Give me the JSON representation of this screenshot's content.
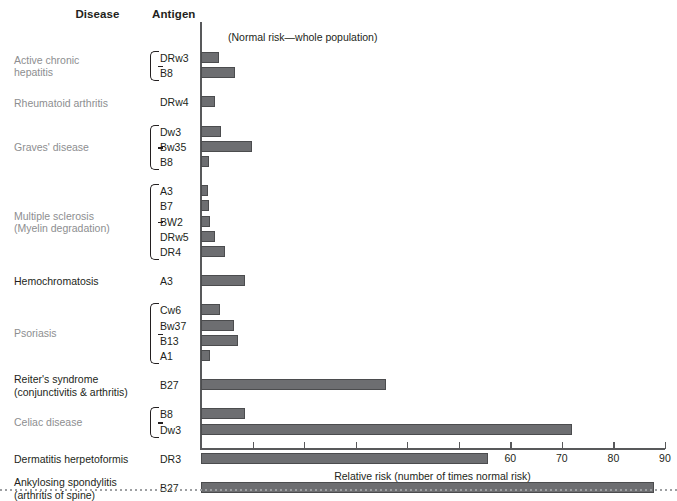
{
  "headers": {
    "disease": "Disease",
    "antigen": "Antigen"
  },
  "note": "(Normal risk—whole population)",
  "chart_data": {
    "type": "bar",
    "orientation": "horizontal",
    "title": "",
    "xlabel": "Relative risk (number of times normal risk)",
    "ylabel": "",
    "xlim": [
      0,
      90
    ],
    "xticks": [
      10,
      20,
      30,
      40,
      50,
      60,
      70,
      80,
      90
    ],
    "grid": false,
    "legend": null,
    "annotations": [
      "(Normal risk—whole population)"
    ],
    "categories": [
      "DRw3",
      "B8",
      "DRw4",
      "Dw3",
      "Bw35",
      "B8",
      "A3",
      "B7",
      "BW2",
      "DRw5",
      "DR4",
      "A3",
      "Cw6",
      "Bw37",
      "B13",
      "A1",
      "B27",
      "B8",
      "Dw3",
      "DR3",
      "B27"
    ],
    "values": [
      3.4,
      6.6,
      2.7,
      3.9,
      9.8,
      1.6,
      1.3,
      1.6,
      1.8,
      2.8,
      4.6,
      8.5,
      3.6,
      6.4,
      7.2,
      1.8,
      35.9,
      8.6,
      72.0,
      55.6,
      87.8
    ],
    "groups": [
      {
        "disease": "Active chronic hepatitis",
        "disease_lines": [
          "Active chronic",
          "hepatitis"
        ],
        "muted": true,
        "brace": true,
        "rows": [
          {
            "antigen": "DRw3",
            "value": 3.4
          },
          {
            "antigen": "B8",
            "value": 6.6
          }
        ]
      },
      {
        "disease": "Rheumatoid arthritis",
        "disease_lines": [
          "Rheumatoid arthritis"
        ],
        "muted": true,
        "brace": false,
        "rows": [
          {
            "antigen": "DRw4",
            "value": 2.7
          }
        ]
      },
      {
        "disease": "Graves' disease",
        "disease_lines": [
          "Graves' disease"
        ],
        "muted": true,
        "brace": true,
        "rows": [
          {
            "antigen": "Dw3",
            "value": 3.9
          },
          {
            "antigen": "Bw35",
            "value": 9.8
          },
          {
            "antigen": "B8",
            "value": 1.6
          }
        ]
      },
      {
        "disease": "Multiple sclerosis (Myelin degradation)",
        "disease_lines": [
          "Multiple sclerosis",
          "(Myelin degradation)"
        ],
        "muted": true,
        "brace": true,
        "rows": [
          {
            "antigen": "A3",
            "value": 1.3
          },
          {
            "antigen": "B7",
            "value": 1.6
          },
          {
            "antigen": "BW2",
            "value": 1.8
          },
          {
            "antigen": "DRw5",
            "value": 2.8
          },
          {
            "antigen": "DR4",
            "value": 4.6
          }
        ]
      },
      {
        "disease": "Hemochromatosis",
        "disease_lines": [
          "Hemochromatosis"
        ],
        "muted": false,
        "brace": false,
        "rows": [
          {
            "antigen": "A3",
            "value": 8.5
          }
        ]
      },
      {
        "disease": "Psoriasis",
        "disease_lines": [
          "Psoriasis"
        ],
        "muted": true,
        "brace": true,
        "rows": [
          {
            "antigen": "Cw6",
            "value": 3.6
          },
          {
            "antigen": "Bw37",
            "value": 6.4
          },
          {
            "antigen": "B13",
            "value": 7.2
          },
          {
            "antigen": "A1",
            "value": 1.8
          }
        ]
      },
      {
        "disease": "Reiter's syndrome (conjunctivitis & arthritis)",
        "disease_lines": [
          "Reiter's syndrome",
          "(conjunctivitis & arthritis)"
        ],
        "muted": false,
        "brace": false,
        "rows": [
          {
            "antigen": "B27",
            "value": 35.9
          }
        ]
      },
      {
        "disease": "Celiac disease",
        "disease_lines": [
          "Celiac disease"
        ],
        "muted": true,
        "brace": true,
        "rows": [
          {
            "antigen": "B8",
            "value": 8.6
          },
          {
            "antigen": "Dw3",
            "value": 72.0
          }
        ]
      },
      {
        "disease": "Dermatitis herpetoformis",
        "disease_lines": [
          "Dermatitis herpetoformis"
        ],
        "muted": false,
        "brace": false,
        "rows": [
          {
            "antigen": "DR3",
            "value": 55.6
          }
        ]
      },
      {
        "disease": "Ankylosing spondylitis (arthritis of spine)",
        "disease_lines": [
          "Ankylosing spondylitis",
          "(arthritis of spine)"
        ],
        "muted": false,
        "brace": false,
        "rows": [
          {
            "antigen": "B27",
            "value": 87.8
          }
        ]
      }
    ]
  },
  "colors": {
    "bar_fill": "#6d6e71",
    "bar_stroke": "#4b4c4e",
    "axis": "#58595b",
    "text": "#231f20",
    "text_muted": "#8d8e90"
  }
}
